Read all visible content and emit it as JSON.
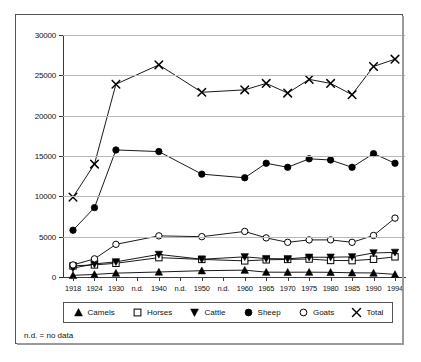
{
  "figure": {
    "footnote": "n.d. = no data"
  },
  "legend": {
    "position": "bottom",
    "items": [
      {
        "label": "Camels",
        "marker": "filled-triangle-up-icon"
      },
      {
        "label": "Horses",
        "marker": "open-square-icon"
      },
      {
        "label": "Cattle",
        "marker": "filled-triangle-down-icon"
      },
      {
        "label": "Sheep",
        "marker": "filled-circle-icon"
      },
      {
        "label": "Goats",
        "marker": "open-circle-icon"
      },
      {
        "label": "Total",
        "marker": "cross-x-icon"
      }
    ]
  },
  "chart_data": {
    "type": "line",
    "title": "",
    "xlabel": "",
    "ylabel": "",
    "ylim": [
      0,
      30000
    ],
    "ytick_values": [
      0,
      5000,
      10000,
      15000,
      20000,
      25000,
      30000
    ],
    "ytick_labels": [
      "0",
      "5000",
      "10000",
      "15000",
      "20000",
      "25000",
      "30000"
    ],
    "grid": true,
    "grid_axis": "y",
    "categories": [
      "1918",
      "1924",
      "1930",
      "n.d.",
      "1940",
      "n.d.",
      "1950",
      "n.d.",
      "1960",
      "1965",
      "1970",
      "1975",
      "1980",
      "1985",
      "1990",
      "1994"
    ],
    "missing_category_label": "n.d.",
    "series": [
      {
        "name": "Camels",
        "marker": "filled-triangle-up-icon",
        "color": "#000000",
        "values": [
          200,
          320,
          480,
          null,
          620,
          null,
          780,
          null,
          850,
          600,
          590,
          600,
          580,
          520,
          500,
          330
        ]
      },
      {
        "name": "Horses",
        "marker": "open-square-icon",
        "color": "#000000",
        "values": [
          1380,
          1500,
          1700,
          null,
          2400,
          null,
          2180,
          null,
          2000,
          2130,
          2180,
          2230,
          2050,
          2030,
          2200,
          2500
        ]
      },
      {
        "name": "Cattle",
        "marker": "filled-triangle-down-icon",
        "color": "#000000",
        "values": [
          1100,
          1620,
          1880,
          null,
          2800,
          null,
          2200,
          null,
          2500,
          2280,
          2250,
          2450,
          2450,
          2500,
          2980,
          3050
        ]
      },
      {
        "name": "Sheep",
        "marker": "filled-circle-icon",
        "color": "#000000",
        "values": [
          5800,
          8600,
          15750,
          null,
          15550,
          null,
          12750,
          null,
          12300,
          14100,
          13600,
          14650,
          14500,
          13600,
          15300,
          14100
        ]
      },
      {
        "name": "Goats",
        "marker": "open-circle-icon",
        "color": "#000000",
        "values": [
          1500,
          2250,
          4050,
          null,
          5100,
          null,
          5000,
          null,
          5650,
          4850,
          4300,
          4600,
          4600,
          4300,
          5150,
          7300
        ]
      },
      {
        "name": "Total",
        "marker": "cross-x-icon",
        "color": "#000000",
        "values": [
          9900,
          14000,
          23900,
          null,
          26300,
          null,
          22900,
          null,
          23200,
          24000,
          22800,
          24500,
          24000,
          22600,
          26100,
          27000
        ]
      }
    ]
  }
}
